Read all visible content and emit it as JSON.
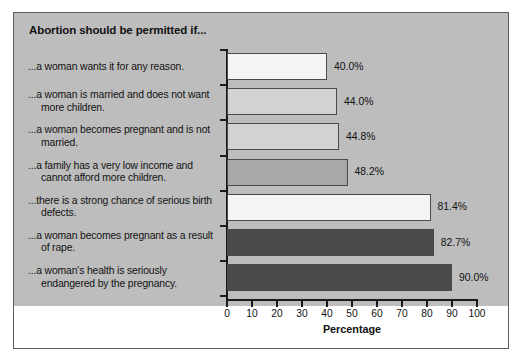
{
  "chart_data": {
    "type": "bar",
    "orientation": "horizontal",
    "title": "Abortion should be permitted if...",
    "xlabel": "Percentage",
    "ylabel": "",
    "xlim": [
      0,
      100
    ],
    "xticks": [
      0,
      10,
      20,
      30,
      40,
      50,
      60,
      70,
      80,
      90,
      100
    ],
    "grid": false,
    "legend": false,
    "categories": [
      "...a woman wants it for any reason.",
      "...a woman is married and does not want more children.",
      "...a woman becomes pregnant and is not married.",
      "...a family has a very low income and cannot afford more children.",
      "...there is a strong chance of serious birth defects.",
      "...a woman becomes pregnant as a result of rape.",
      "...a woman's health is seriously endangered by the pregnancy."
    ],
    "values": [
      40.0,
      44.0,
      44.8,
      48.2,
      81.4,
      82.7,
      90.0
    ],
    "value_labels": [
      "40.0%",
      "44.0%",
      "44.8%",
      "48.2%",
      "81.4%",
      "82.7%",
      "90.0%"
    ],
    "bar_colors": [
      "#f4f4f2",
      "#d2d2d0",
      "#d2d2d0",
      "#a8a8a6",
      "#f4f4f2",
      "#4a4a4a",
      "#4a4a4a"
    ],
    "panel_background": "#bdbdbd",
    "figure_background": "#ffffff",
    "axis_color": "#1a1a1a",
    "bar_edge_color": "#4a4a4a"
  }
}
